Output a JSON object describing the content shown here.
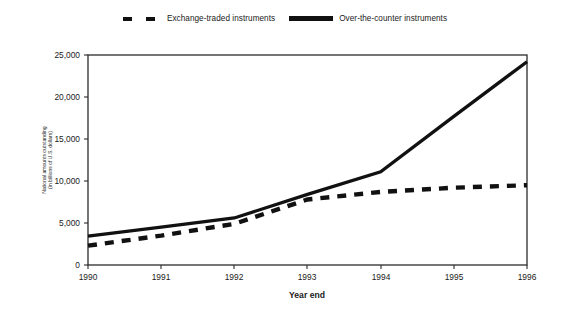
{
  "chart_data": {
    "type": "line",
    "title": "",
    "xlabel": "Year end",
    "ylabel": "National amounts outstanding (in billions of U.S. dollars)",
    "ylabel_line1": "National amounts outstanding",
    "ylabel_line2": "(in billions of U.S. dollars)",
    "categories": [
      "1990",
      "1991",
      "1992",
      "1993",
      "1994",
      "1995",
      "1996"
    ],
    "x": [
      1990,
      1991,
      1992,
      1993,
      1994,
      1995,
      1996
    ],
    "xlim": [
      1990,
      1996
    ],
    "ylim": [
      0,
      25000
    ],
    "yticks": [
      0,
      5000,
      10000,
      15000,
      20000,
      25000
    ],
    "ytick_labels": [
      "0",
      "5,000",
      "10,000",
      "15,000",
      "20,000",
      "25,000"
    ],
    "grid": false,
    "legend_position": "top-center",
    "series": [
      {
        "name": "Exchange-traded instruments",
        "style": "dashed",
        "color": "#111111",
        "values": [
          2300,
          3500,
          4900,
          7800,
          8700,
          9200,
          9500
        ]
      },
      {
        "name": "Over-the-counter instruments",
        "style": "solid",
        "color": "#111111",
        "values": [
          3450,
          4500,
          5600,
          8400,
          11100,
          17700,
          24200
        ]
      }
    ]
  },
  "legend": {
    "items": [
      {
        "label": "Exchange-traded instruments",
        "style": "dashed"
      },
      {
        "label": "Over-the-counter instruments",
        "style": "solid"
      }
    ]
  },
  "axes": {
    "x_title": "Year end",
    "y_title_line1": "National amounts outstanding",
    "y_title_line2": "(in billions of U.S. dollars)",
    "x_tick_labels": [
      "1990",
      "1991",
      "1992",
      "1993",
      "1994",
      "1995",
      "1996"
    ],
    "y_tick_labels": [
      "25,000",
      "20,000",
      "15,000",
      "10,000",
      "5,000",
      "0"
    ]
  },
  "colors": {
    "ink": "#111111",
    "axis": "#2b2b2b",
    "background": "#ffffff"
  }
}
